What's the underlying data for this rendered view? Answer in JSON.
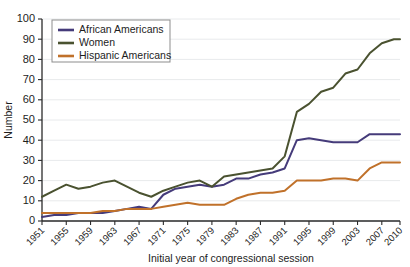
{
  "chart_data": {
    "type": "line",
    "title": "",
    "xlabel": "Initial year of congressional session",
    "ylabel": "Number",
    "xlim": [
      1951,
      2010
    ],
    "ylim": [
      0,
      100
    ],
    "grid": true,
    "legend_position": "top-left",
    "y_ticks": [
      0,
      10,
      20,
      30,
      40,
      50,
      60,
      70,
      80,
      90,
      100
    ],
    "x_ticks": [
      1951,
      1955,
      1959,
      1963,
      1967,
      1971,
      1975,
      1979,
      1983,
      1987,
      1991,
      1995,
      1999,
      2003,
      2007,
      2010
    ],
    "x": [
      1951,
      1953,
      1955,
      1957,
      1959,
      1961,
      1963,
      1965,
      1967,
      1969,
      1971,
      1973,
      1975,
      1977,
      1979,
      1981,
      1983,
      1985,
      1987,
      1989,
      1991,
      1993,
      1995,
      1997,
      1999,
      2001,
      2003,
      2005,
      2007,
      2009,
      2010
    ],
    "series": [
      {
        "name": "African Americans",
        "color": "#453b7a",
        "values": [
          2,
          3,
          3,
          4,
          4,
          4,
          5,
          6,
          7,
          6,
          13,
          16,
          17,
          18,
          17,
          18,
          21,
          21,
          23,
          24,
          26,
          40,
          41,
          40,
          39,
          39,
          39,
          43,
          43,
          43,
          43
        ]
      },
      {
        "name": "Women",
        "color": "#4a5230",
        "values": [
          12,
          15,
          18,
          16,
          17,
          19,
          20,
          17,
          14,
          12,
          15,
          17,
          19,
          20,
          17,
          22,
          23,
          24,
          25,
          26,
          32,
          54,
          58,
          64,
          66,
          73,
          75,
          83,
          88,
          90,
          90
        ]
      },
      {
        "name": "Hispanic Americans",
        "color": "#c0712a",
        "values": [
          4,
          4,
          4,
          4,
          4,
          5,
          5,
          6,
          6,
          6,
          7,
          8,
          9,
          8,
          8,
          8,
          11,
          13,
          14,
          14,
          15,
          20,
          20,
          20,
          21,
          21,
          20,
          26,
          29,
          29,
          29
        ]
      }
    ]
  },
  "legend": {
    "items": [
      {
        "label": "African Americans",
        "color": "#453b7a"
      },
      {
        "label": "Women",
        "color": "#4a5230"
      },
      {
        "label": "Hispanic Americans",
        "color": "#c0712a"
      }
    ]
  }
}
